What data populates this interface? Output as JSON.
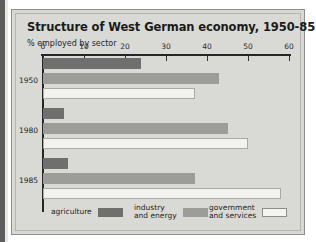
{
  "figure": {
    "title": "Structure of West German economy, 1950-85",
    "axis_title": "% employed by sector"
  },
  "legend": {
    "items": [
      {
        "label": "agriculture",
        "swatch": "dark-gray-swatch",
        "color": "#6f6f6d"
      },
      {
        "label": "industry\nand energy",
        "swatch": "mid-gray-swatch",
        "color": "#9c9c99"
      },
      {
        "label": "government\nand services",
        "swatch": "white-swatch",
        "color": "#f2f2ef"
      }
    ]
  },
  "chart_data": {
    "type": "bar",
    "orientation": "horizontal",
    "title": "Structure of West German economy, 1950-85",
    "subtitle": "% employed by sector",
    "xlabel": "% employed by sector",
    "ylabel": "",
    "xlim": [
      0,
      60
    ],
    "xticks": [
      0,
      10,
      20,
      30,
      40,
      50,
      60
    ],
    "xtick_labels": [
      "0",
      "10",
      "20",
      "30",
      "40",
      "50",
      "60"
    ],
    "grid": false,
    "legend_position": "bottom",
    "categories": [
      "1950",
      "1980",
      "1985"
    ],
    "series": [
      {
        "name": "agriculture",
        "color": "#6f6f6d",
        "values": [
          24,
          5,
          6
        ]
      },
      {
        "name": "industry and energy",
        "color": "#9c9c99",
        "values": [
          43,
          45,
          37
        ]
      },
      {
        "name": "government and services",
        "color": "#f2f2ef",
        "values": [
          37,
          50,
          58
        ]
      }
    ]
  }
}
